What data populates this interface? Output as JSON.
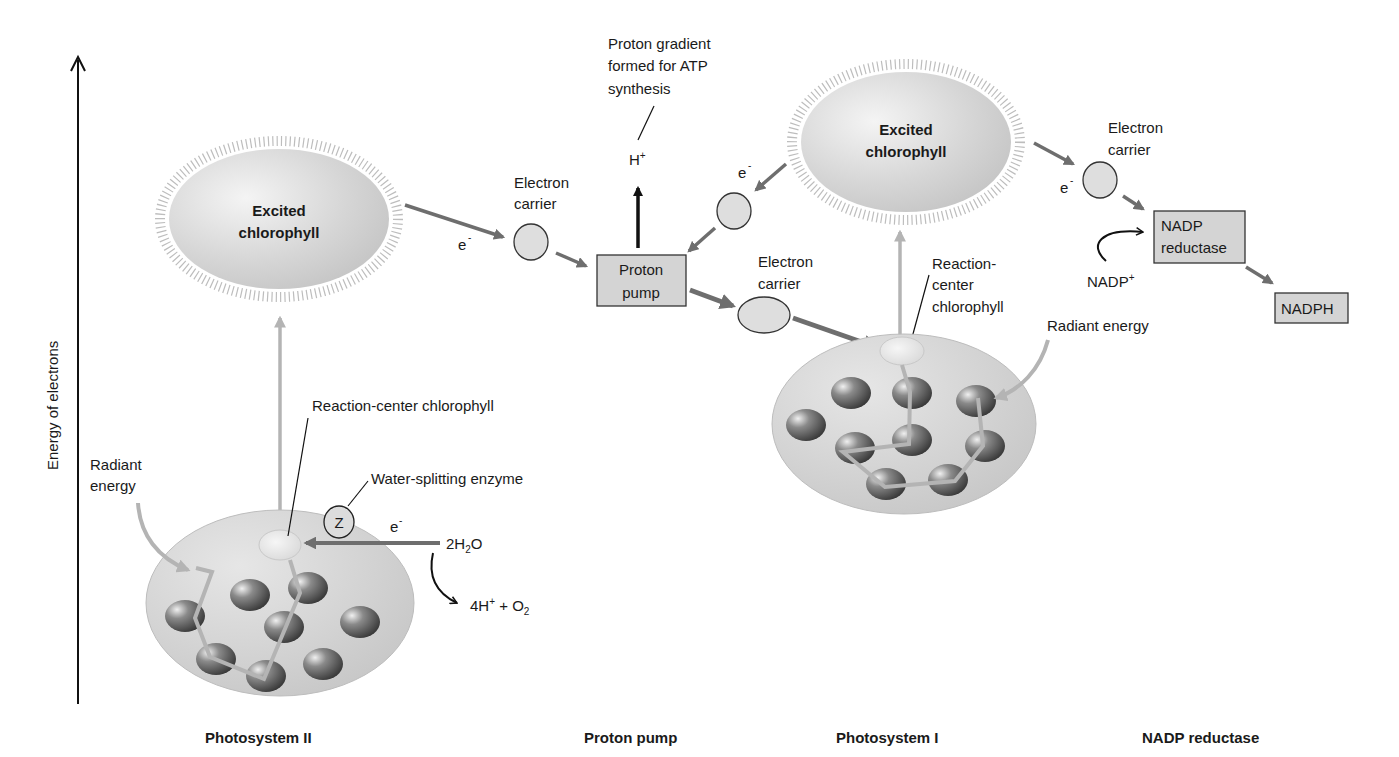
{
  "axis": {
    "label": "Energy of electrons"
  },
  "sections": {
    "photosystem_ii": "Photosystem II",
    "proton_pump": "Proton pump",
    "photosystem_i": "Photosystem I",
    "nadp_reductase": "NADP reductase"
  },
  "psii": {
    "excited_line1": "Excited",
    "excited_line2": "chlorophyll",
    "radiant_line1": "Radiant",
    "radiant_line2": "energy",
    "reaction_center": "Reaction-center chlorophyll",
    "water_enzyme": "Water-splitting enzyme",
    "z_label": "Z",
    "electron": "e",
    "electron_sup": "-",
    "water_pre": "2H",
    "water_sub": "2",
    "water_post": "O",
    "products_pre": "4H",
    "products_sup": "+",
    "products_mid": " + O",
    "products_sub": "2"
  },
  "carrier1": {
    "line1": "Electron",
    "line2": "carrier",
    "electron": "e",
    "electron_sup": "-"
  },
  "pump": {
    "line1": "Proton",
    "line2": "pump",
    "gradient_line1": "Proton gradient",
    "gradient_line2": "formed for ATP",
    "gradient_line3": "synthesis",
    "proton": "H",
    "proton_sup": "+"
  },
  "carrier2": {
    "line1": "Electron",
    "line2": "carrier"
  },
  "carrier3": {
    "electron": "e",
    "electron_sup": "-"
  },
  "psi": {
    "excited_line1": "Excited",
    "excited_line2": "chlorophyll",
    "rc_line1": "Reaction-",
    "rc_line2": "center",
    "rc_line3": "chlorophyll",
    "radiant": "Radiant energy"
  },
  "carrier4": {
    "line1": "Electron",
    "line2": "carrier",
    "electron": "e",
    "electron_sup": "-"
  },
  "nadp": {
    "box_line1": "NADP",
    "box_line2": "reductase",
    "input": "NADP",
    "input_sup": "+",
    "output": "NADPH"
  },
  "colors": {
    "arrow_gray": "#6e6e6e",
    "light_arrow": "#b4b4b4",
    "box_fill": "#d4d4d4",
    "carrier_fill": "#dedede",
    "ellipse_fill": "#d2d2d2"
  }
}
